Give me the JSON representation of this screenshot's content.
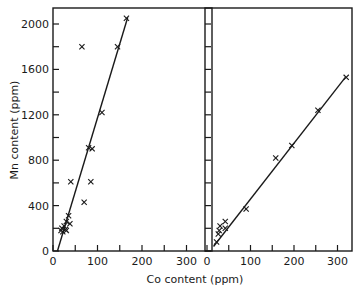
{
  "chart_data": [
    {
      "type": "scatter",
      "panel": "left",
      "title": "",
      "xlabel": "Co content (ppm)",
      "ylabel": "Mn content (ppm)",
      "xlim": [
        0,
        330
      ],
      "ylim": [
        0,
        2100
      ],
      "xticks": [
        0,
        100,
        200,
        300
      ],
      "xtick_labels": [
        "0",
        "100",
        "200",
        "300"
      ],
      "yticks": [
        0,
        400,
        800,
        1200,
        1600,
        2000
      ],
      "ytick_labels": [
        "0",
        "400",
        "800",
        "1200",
        "1600",
        "2000"
      ],
      "grid": false,
      "marker": "x",
      "points": [
        {
          "x": 165,
          "y": 2050
        },
        {
          "x": 145,
          "y": 1800
        },
        {
          "x": 65,
          "y": 1800
        },
        {
          "x": 110,
          "y": 1220
        },
        {
          "x": 80,
          "y": 910
        },
        {
          "x": 88,
          "y": 900
        },
        {
          "x": 40,
          "y": 610
        },
        {
          "x": 85,
          "y": 610
        },
        {
          "x": 70,
          "y": 430
        },
        {
          "x": 35,
          "y": 310
        },
        {
          "x": 30,
          "y": 260
        },
        {
          "x": 38,
          "y": 240
        },
        {
          "x": 25,
          "y": 220
        },
        {
          "x": 20,
          "y": 200
        },
        {
          "x": 28,
          "y": 190
        },
        {
          "x": 18,
          "y": 180
        },
        {
          "x": 22,
          "y": 170
        },
        {
          "x": 30,
          "y": 180
        }
      ],
      "fit_line": {
        "x": [
          10,
          168
        ],
        "y": [
          0,
          2060
        ]
      }
    },
    {
      "type": "scatter",
      "panel": "right",
      "title": "",
      "xlabel": "Co content (ppm)",
      "ylabel": "",
      "xlim": [
        0,
        330
      ],
      "ylim": [
        0,
        2100
      ],
      "xticks": [
        0,
        100,
        200,
        300
      ],
      "xtick_labels": [
        "0",
        "100",
        "200",
        "300"
      ],
      "yticks": [
        0,
        400,
        800,
        1200,
        1600,
        2000
      ],
      "ytick_labels": [],
      "grid": false,
      "marker": "x",
      "points": [
        {
          "x": 320,
          "y": 1530
        },
        {
          "x": 255,
          "y": 1240
        },
        {
          "x": 195,
          "y": 930
        },
        {
          "x": 158,
          "y": 820
        },
        {
          "x": 90,
          "y": 370
        },
        {
          "x": 42,
          "y": 260
        },
        {
          "x": 42,
          "y": 200
        },
        {
          "x": 30,
          "y": 220
        },
        {
          "x": 28,
          "y": 180
        },
        {
          "x": 26,
          "y": 150
        },
        {
          "x": 22,
          "y": 80
        }
      ],
      "fit_line": {
        "x": [
          15,
          318
        ],
        "y": [
          40,
          1530
        ]
      }
    }
  ],
  "axis_titles": {
    "x": "Co content (ppm)",
    "y": "Mn content (ppm)"
  }
}
